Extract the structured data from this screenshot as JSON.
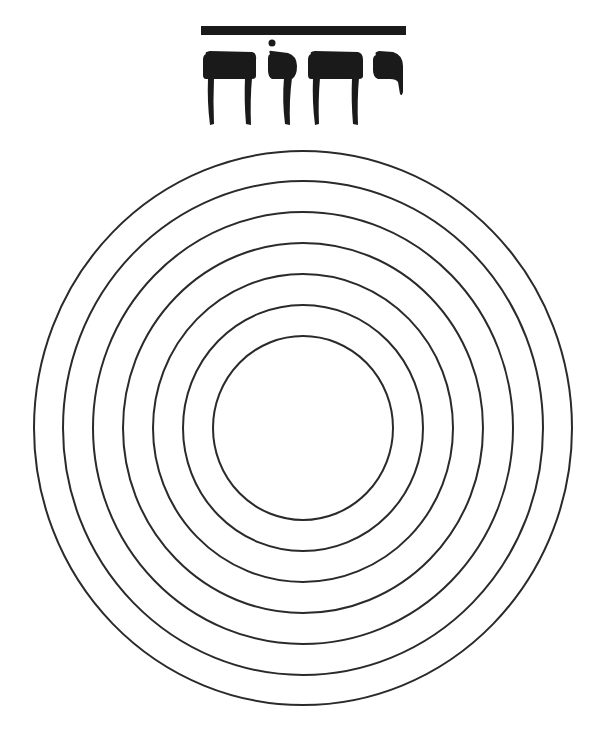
{
  "title": {
    "hebrew_text": "יהוה",
    "overline": true
  },
  "figure": {
    "type": "concentric-circles",
    "ring_count": 7,
    "center": [
      303,
      428
    ],
    "rx": [
      269,
      240,
      210,
      180,
      150,
      120,
      90
    ],
    "ry": [
      277,
      247,
      216,
      185,
      154,
      123,
      92
    ]
  },
  "colors": {
    "background": "#ffffff",
    "ink": "#1a1a1a",
    "ring_stroke": "#2a2a2a"
  }
}
